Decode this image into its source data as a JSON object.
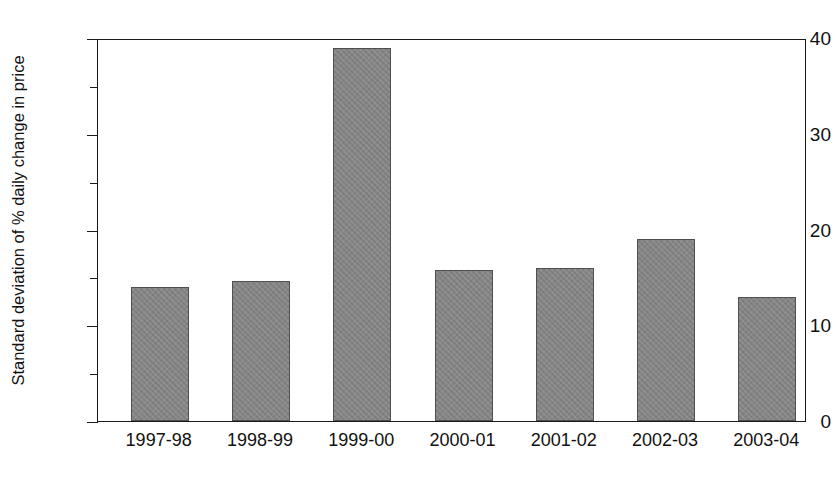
{
  "chart_data": {
    "type": "bar",
    "title": "",
    "xlabel": "",
    "ylabel": "Standard deviation of % daily change in price",
    "categories": [
      "1997-98",
      "1998-99",
      "1999-00",
      "2000-01",
      "2001-02",
      "2002-03",
      "2003-04"
    ],
    "values": [
      14.0,
      14.6,
      39.0,
      15.8,
      16.0,
      19.0,
      13.0
    ],
    "ylim": [
      0,
      40
    ],
    "yticks_major": [
      0,
      10,
      20,
      30,
      40
    ],
    "yticks_major_labels": [
      "0",
      "10",
      "20",
      "30",
      "40"
    ],
    "yticks_minor": [
      5,
      15,
      25,
      35
    ],
    "grid": false,
    "legend": "none",
    "bar_color": "#838383",
    "bar_edge_color": "#4f4f4f",
    "axis_color": "#1a1a1a",
    "background": "#ffffff"
  }
}
